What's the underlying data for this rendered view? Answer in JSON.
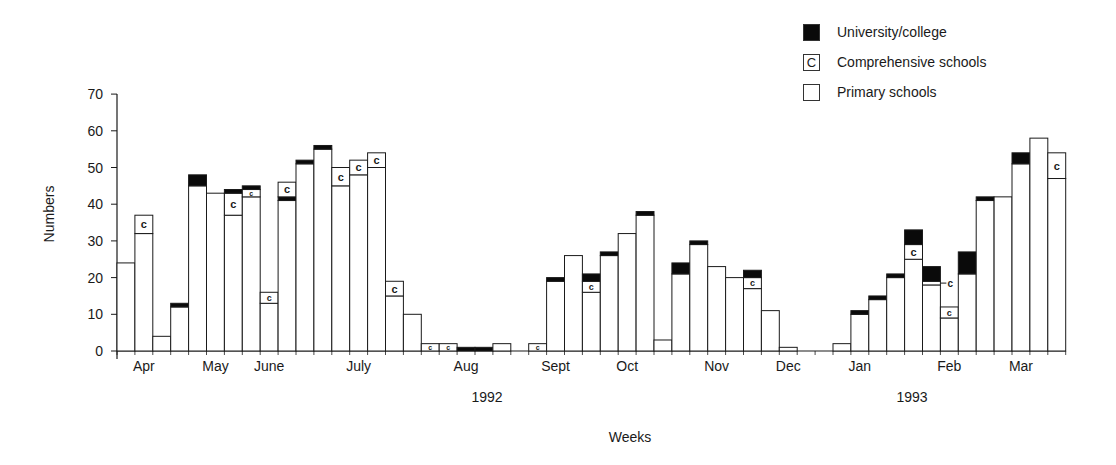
{
  "chart_data": {
    "type": "bar",
    "stacked": true,
    "title": "",
    "xlabel": "Weeks",
    "ylabel": "Numbers",
    "ylim": [
      0,
      70
    ],
    "yticks": [
      0,
      10,
      20,
      30,
      40,
      50,
      60,
      70
    ],
    "grid": false,
    "legend_position": "top-right",
    "legend": [
      {
        "name": "University/college",
        "style": "solid-black",
        "marker": ""
      },
      {
        "name": "Comprehensive schools",
        "style": "box-with-c",
        "marker": "C"
      },
      {
        "name": "Primary schools",
        "style": "white-box",
        "marker": ""
      }
    ],
    "month_labels": [
      {
        "label": "Apr",
        "week": 2
      },
      {
        "label": "May",
        "week": 6
      },
      {
        "label": "June",
        "week": 9
      },
      {
        "label": "July",
        "week": 14
      },
      {
        "label": "Aug",
        "week": 20
      },
      {
        "label": "Sept",
        "week": 25
      },
      {
        "label": "Oct",
        "week": 29
      },
      {
        "label": "Nov",
        "week": 34
      },
      {
        "label": "Dec",
        "week": 38
      },
      {
        "label": "Jan",
        "week": 42
      },
      {
        "label": "Feb",
        "week": 47
      },
      {
        "label": "Mar",
        "week": 51
      }
    ],
    "year_labels": [
      {
        "label": "1992",
        "x": 487
      },
      {
        "label": "1993",
        "x": 912
      }
    ],
    "series_order_bottom_to_top": [
      "Primary schools",
      "Comprehensive schools",
      "University/college"
    ],
    "weeks": [
      {
        "primary": 24,
        "comprehensive": 0,
        "university": 0
      },
      {
        "primary": 32,
        "comprehensive": 5,
        "university": 0
      },
      {
        "primary": 4,
        "comprehensive": 0,
        "university": 0
      },
      {
        "primary": 12,
        "comprehensive": 0,
        "university": 1
      },
      {
        "primary": 45,
        "comprehensive": 0,
        "university": 3
      },
      {
        "primary": 43,
        "comprehensive": 0,
        "university": 0
      },
      {
        "primary": 37,
        "comprehensive": 6,
        "university": 1
      },
      {
        "primary": 42,
        "comprehensive": 2,
        "university": 1
      },
      {
        "primary": 13,
        "comprehensive": 3,
        "university": 0
      },
      {
        "primary": 41,
        "comprehensive": 4,
        "university": 1,
        "university_below_comprehensive": true
      },
      {
        "primary": 51,
        "comprehensive": 0,
        "university": 1
      },
      {
        "primary": 55,
        "comprehensive": 0,
        "university": 1
      },
      {
        "primary": 45,
        "comprehensive": 5,
        "university": 0
      },
      {
        "primary": 48,
        "comprehensive": 4,
        "university": 0
      },
      {
        "primary": 50,
        "comprehensive": 4,
        "university": 0
      },
      {
        "primary": 15,
        "comprehensive": 4,
        "university": 0
      },
      {
        "primary": 10,
        "comprehensive": 0,
        "university": 0
      },
      {
        "primary": 0,
        "comprehensive": 2,
        "university": 0
      },
      {
        "primary": 0,
        "comprehensive": 2,
        "university": 0
      },
      {
        "primary": 0,
        "comprehensive": 0,
        "university": 1
      },
      {
        "primary": 0,
        "comprehensive": 0,
        "university": 1
      },
      {
        "primary": 2,
        "comprehensive": 0,
        "university": 0
      },
      {
        "primary": 0,
        "comprehensive": 0,
        "university": 0
      },
      {
        "primary": 0,
        "comprehensive": 2,
        "university": 0
      },
      {
        "primary": 19,
        "comprehensive": 0,
        "university": 1
      },
      {
        "primary": 26,
        "comprehensive": 0,
        "university": 0
      },
      {
        "primary": 16,
        "comprehensive": 3,
        "university": 2
      },
      {
        "primary": 26,
        "comprehensive": 0,
        "university": 1
      },
      {
        "primary": 32,
        "comprehensive": 0,
        "university": 0
      },
      {
        "primary": 37,
        "comprehensive": 0,
        "university": 1
      },
      {
        "primary": 3,
        "comprehensive": 0,
        "university": 0
      },
      {
        "primary": 21,
        "comprehensive": 0,
        "university": 3
      },
      {
        "primary": 29,
        "comprehensive": 0,
        "university": 1
      },
      {
        "primary": 23,
        "comprehensive": 0,
        "university": 0
      },
      {
        "primary": 20,
        "comprehensive": 0,
        "university": 0
      },
      {
        "primary": 17,
        "comprehensive": 3,
        "university": 2
      },
      {
        "primary": 11,
        "comprehensive": 0,
        "university": 0
      },
      {
        "primary": 1,
        "comprehensive": 0,
        "university": 0
      },
      {
        "primary": 0,
        "comprehensive": 0,
        "university": 0
      },
      {
        "primary": 0,
        "comprehensive": 0,
        "university": 0
      },
      {
        "primary": 2,
        "comprehensive": 0,
        "university": 0
      },
      {
        "primary": 10,
        "comprehensive": 0,
        "university": 1
      },
      {
        "primary": 14,
        "comprehensive": 0,
        "university": 1
      },
      {
        "primary": 20,
        "comprehensive": 0,
        "university": 1
      },
      {
        "primary": 25,
        "comprehensive": 4,
        "university": 4
      },
      {
        "primary": 18,
        "comprehensive": 1,
        "university": 4,
        "comprehensive_callout": true
      },
      {
        "primary": 9,
        "comprehensive": 3,
        "university": 0
      },
      {
        "primary": 21,
        "comprehensive": 0,
        "university": 6
      },
      {
        "primary": 41,
        "comprehensive": 0,
        "university": 1
      },
      {
        "primary": 42,
        "comprehensive": 0,
        "university": 0
      },
      {
        "primary": 51,
        "comprehensive": 0,
        "university": 3
      },
      {
        "primary": 58,
        "comprehensive": 0,
        "university": 0
      },
      {
        "primary": 47,
        "comprehensive": 7,
        "university": 0
      }
    ]
  },
  "legend": {
    "items": [
      {
        "label": "University/college",
        "marker": ""
      },
      {
        "label": "Comprehensive schools",
        "marker": "C"
      },
      {
        "label": "Primary schools",
        "marker": ""
      }
    ]
  },
  "axes": {
    "ylabel": "Numbers",
    "xlabel": "Weeks"
  },
  "colors": {
    "ink": "#1a1a1a",
    "university_fill": "#0a0a0a",
    "bar_fill": "#ffffff",
    "background": "#ffffff"
  }
}
